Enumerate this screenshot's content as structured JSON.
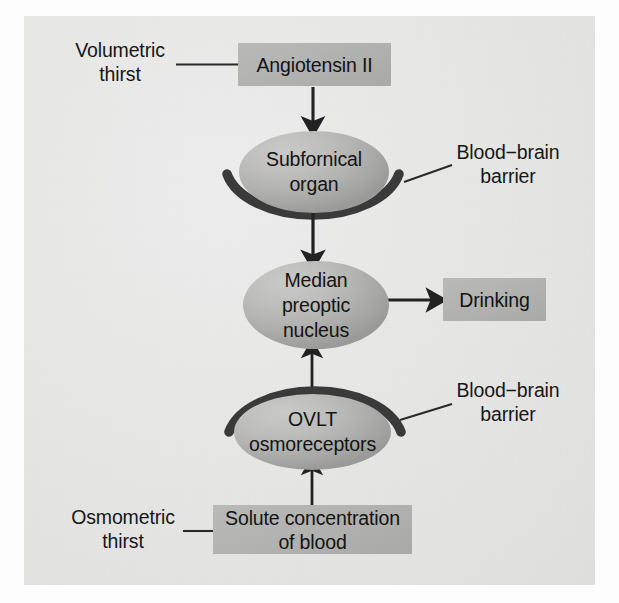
{
  "figure": {
    "type": "flow-diagram",
    "background_color": "#e6e6e5",
    "box_fill": "#b3b3b1",
    "ellipse_fill": "#b5b5b3",
    "stroke_color": "#2b2b2b",
    "text_color": "#151515"
  },
  "nodes": {
    "volumetric_thirst": {
      "label": "Volumetric\nthirst",
      "kind": "side-label"
    },
    "angiotensin": {
      "label": "Angiotensin II",
      "kind": "box"
    },
    "subfornical_organ": {
      "label": "Subfornical\norgan",
      "kind": "ellipse"
    },
    "bbb_top": {
      "label": "Blood−brain\nbarrier",
      "kind": "side-label"
    },
    "median_preoptic_nucleus": {
      "label": "Median\npreoptic\nnucleus",
      "kind": "ellipse"
    },
    "drinking": {
      "label": "Drinking",
      "kind": "box"
    },
    "bbb_bottom": {
      "label": "Blood−brain\nbarrier",
      "kind": "side-label"
    },
    "ovlt": {
      "label": "OVLT\nosmoreceptors",
      "kind": "ellipse"
    },
    "solute_concentration": {
      "label": "Solute concentration\nof blood",
      "kind": "box"
    },
    "osmometric_thirst": {
      "label": "Osmometric\nthirst",
      "kind": "side-label"
    }
  },
  "edges": [
    {
      "from": "volumetric_thirst",
      "to": "angiotensin",
      "style": "plain-line",
      "direction": "none"
    },
    {
      "from": "angiotensin",
      "to": "subfornical_organ",
      "style": "arrow",
      "direction": "down"
    },
    {
      "from": "subfornical_organ",
      "to": "median_preoptic_nucleus",
      "style": "arrow",
      "direction": "down"
    },
    {
      "from": "median_preoptic_nucleus",
      "to": "drinking",
      "style": "arrow",
      "direction": "right"
    },
    {
      "from": "ovlt",
      "to": "median_preoptic_nucleus",
      "style": "arrow",
      "direction": "up"
    },
    {
      "from": "solute_concentration",
      "to": "ovlt",
      "style": "arrow",
      "direction": "up"
    },
    {
      "from": "osmometric_thirst",
      "to": "solute_concentration",
      "style": "plain-line",
      "direction": "none"
    },
    {
      "from": "bbb_top",
      "to": "subfornical_organ",
      "style": "leader-line",
      "direction": "none"
    },
    {
      "from": "bbb_bottom",
      "to": "ovlt",
      "style": "leader-line",
      "direction": "none"
    }
  ],
  "barriers": [
    {
      "name": "subfornical-barrier-arc",
      "opens": "up"
    },
    {
      "name": "ovlt-barrier-arc",
      "opens": "down"
    }
  ]
}
